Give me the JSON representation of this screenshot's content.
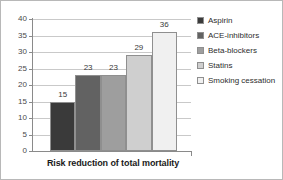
{
  "chart_data": {
    "type": "bar",
    "title": "",
    "subtitle": "",
    "xlabel": "Risk reduction of total mortality",
    "ylabel": "",
    "categories": [
      "Aspirin",
      "ACE-inhibitors",
      "Beta-blockers",
      "Statins",
      "Smoking cessation"
    ],
    "values": [
      15,
      23,
      23,
      29,
      36
    ],
    "data_labels": [
      "15",
      "23",
      "23",
      "29",
      "36"
    ],
    "ylim": [
      0,
      40
    ],
    "ytick_labels": [
      "0",
      "5",
      "10",
      "15",
      "20",
      "25",
      "30",
      "35",
      "40"
    ],
    "ytick_values": [
      0,
      5,
      10,
      15,
      20,
      25,
      30,
      35,
      40
    ],
    "grid": true,
    "grid_axis": "y",
    "legend_position": "right",
    "bar_colors": [
      "#3a3a3a",
      "#626262",
      "#9e9e9e",
      "#cfcfcf",
      "#f0f0f0"
    ],
    "bar_border_color": "#8f8f8f",
    "gridline_color": "#c9c9c9",
    "axis_color": "#8a8a8a",
    "background_color": "#ffffff",
    "legend": [
      {
        "label": "Aspirin",
        "color": "#3a3a3a",
        "swatch_name": "legend-swatch-aspirin"
      },
      {
        "label": "ACE-inhibitors",
        "color": "#626262",
        "swatch_name": "legend-swatch-ace-inhibitors"
      },
      {
        "label": "Beta-blockers",
        "color": "#9e9e9e",
        "swatch_name": "legend-swatch-beta-blockers"
      },
      {
        "label": "Statins",
        "color": "#cfcfcf",
        "swatch_name": "legend-swatch-statins"
      },
      {
        "label": "Smoking cessation",
        "color": "#f0f0f0",
        "swatch_name": "legend-swatch-smoking-cessation"
      }
    ]
  }
}
